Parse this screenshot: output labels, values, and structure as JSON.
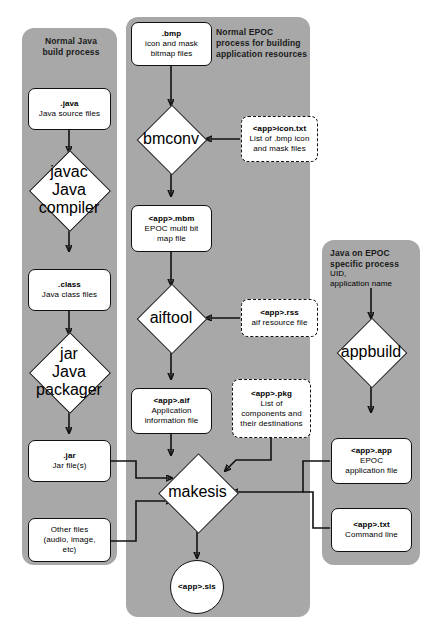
{
  "diagram": {
    "panels": [
      {
        "id": "java",
        "label": "Normal Java\nbuild process"
      },
      {
        "id": "epoc",
        "label": "Normal EPOC\nprocess for building\napplication resources"
      },
      {
        "id": "javaepoc",
        "label": "Java on EPOC\nspecific process"
      }
    ],
    "nodes": {
      "java_src": {
        "title": ".java",
        "sub": "Java source files"
      },
      "javac": {
        "title": "javac",
        "sub": "Java compiler"
      },
      "class": {
        "title": ".class",
        "sub": "Java class files"
      },
      "jar_tool": {
        "title": "jar",
        "sub": "Java packager"
      },
      "jar_file": {
        "title": ".jar",
        "sub": "Jar file(s)"
      },
      "other_files": {
        "title": "",
        "sub": "Other files\n(audio, image,\netc)"
      },
      "bmp": {
        "title": ".bmp",
        "sub": "icon and mask\nbitmap files"
      },
      "bmconv": {
        "title": "bmconv",
        "sub": ""
      },
      "icontxt": {
        "title": "<app>icon.txt",
        "sub": "List of .bmp icon\nand mask files"
      },
      "mbm": {
        "title": "<app>.mbm",
        "sub": "EPOC multi bit\nmap file"
      },
      "aiftool": {
        "title": "aiftool",
        "sub": ""
      },
      "rss": {
        "title": "<app>.rss",
        "sub": "aif resource file"
      },
      "aif": {
        "title": "<app>.aif",
        "sub": "Application\ninformation file"
      },
      "pkg": {
        "title": "<app>.pkg",
        "sub": "List of\ncomponents and\ntheir destinations"
      },
      "makesis": {
        "title": "makesis",
        "sub": ""
      },
      "sis": {
        "title": "<app>.sis",
        "sub": ""
      },
      "uid": {
        "title": "",
        "sub": "UID,\napplication name"
      },
      "appbuild": {
        "title": "appbuild",
        "sub": ""
      },
      "app": {
        "title": "<app>.app",
        "sub": "EPOC\napplication file"
      },
      "txt": {
        "title": "<app>.txt",
        "sub": "Command line"
      }
    },
    "colors": {
      "panel_bg": "#a8a8a8",
      "node_bg": "#ffffff",
      "stroke": "#111111",
      "page_bg": "#ffffff"
    },
    "edges": [
      {
        "from": "java_src",
        "to": "javac"
      },
      {
        "from": "javac",
        "to": "class"
      },
      {
        "from": "class",
        "to": "jar_tool"
      },
      {
        "from": "jar_tool",
        "to": "jar_file"
      },
      {
        "from": "jar_file",
        "to": "makesis"
      },
      {
        "from": "other_files",
        "to": "makesis"
      },
      {
        "from": "bmp",
        "to": "bmconv"
      },
      {
        "from": "icontxt",
        "to": "bmconv"
      },
      {
        "from": "bmconv",
        "to": "mbm"
      },
      {
        "from": "mbm",
        "to": "aiftool"
      },
      {
        "from": "rss",
        "to": "aiftool"
      },
      {
        "from": "aiftool",
        "to": "aif"
      },
      {
        "from": "aif",
        "to": "makesis"
      },
      {
        "from": "pkg",
        "to": "makesis"
      },
      {
        "from": "uid",
        "to": "appbuild"
      },
      {
        "from": "appbuild",
        "to": "app"
      },
      {
        "from": "app",
        "to": "makesis"
      },
      {
        "from": "txt",
        "to": "makesis"
      },
      {
        "from": "makesis",
        "to": "sis"
      }
    ]
  }
}
